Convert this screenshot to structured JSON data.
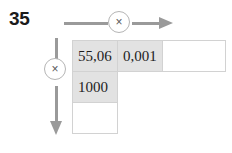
{
  "exercise": {
    "number": "35"
  },
  "operations": {
    "horizontal": {
      "symbol": "×",
      "icon": "multiply-circle-icon",
      "direction": "right",
      "arrow_icon": "arrow-right-icon"
    },
    "vertical": {
      "symbol": "×",
      "icon": "multiply-circle-icon",
      "direction": "down",
      "arrow_icon": "arrow-down-icon"
    }
  },
  "grid": {
    "rows": [
      {
        "cells": [
          {
            "value": "55,06",
            "style": "filled"
          },
          {
            "value": "0,001",
            "style": "filled"
          },
          {
            "value": "",
            "style": "empty"
          }
        ]
      },
      {
        "cells": [
          {
            "value": "1000",
            "style": "filled"
          },
          {
            "value": "",
            "style": "spacer"
          },
          {
            "value": "",
            "style": "spacer"
          }
        ]
      },
      {
        "cells": [
          {
            "value": "",
            "style": "empty"
          },
          {
            "value": "",
            "style": "spacer"
          },
          {
            "value": "",
            "style": "spacer"
          }
        ]
      }
    ]
  },
  "colors": {
    "filled_cell": "#e2e2e2",
    "empty_cell": "#ffffff",
    "cell_border": "#d2d2d2",
    "arrow": "#9a9a9a",
    "badge_border": "#b5b5b5",
    "text": "#1d1d1d",
    "background": "#ffffff"
  }
}
